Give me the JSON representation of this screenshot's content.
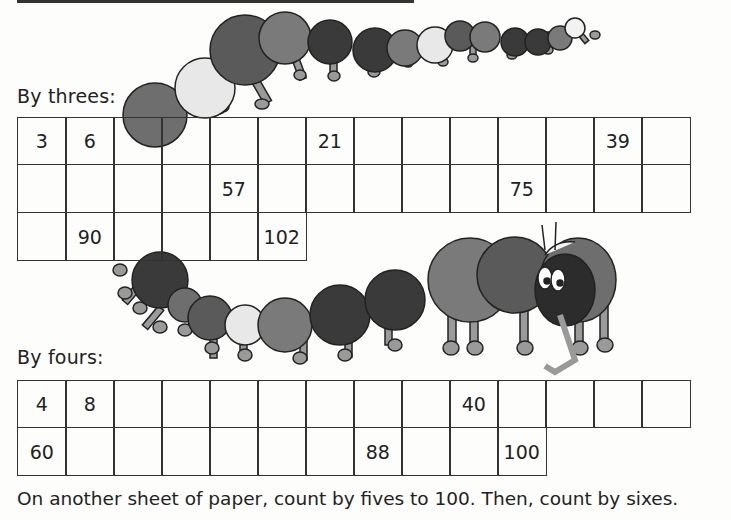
{
  "worksheet": {
    "threes": {
      "label": "By threes:",
      "rows": [
        [
          "3",
          "6",
          "",
          "",
          "",
          "",
          "21",
          "",
          "",
          "",
          "",
          "",
          "39",
          ""
        ],
        [
          "",
          "",
          "",
          "",
          "57",
          "",
          "",
          "",
          "",
          "",
          "75",
          "",
          "",
          ""
        ],
        [
          "",
          "90",
          "",
          "",
          "",
          "102"
        ]
      ]
    },
    "fours": {
      "label": "By fours:",
      "rows": [
        [
          "4",
          "8",
          "",
          "",
          "",
          "",
          "",
          "",
          "",
          "40",
          "",
          "",
          "",
          ""
        ],
        [
          "60",
          "",
          "",
          "",
          "",
          "",
          "",
          "88",
          "",
          "",
          "100"
        ]
      ]
    },
    "instruction": "On another sheet of paper, count by fives to 100. Then, count by sixes."
  },
  "colors": {
    "ink": "#222222",
    "segment_dark": "#3a3a3a",
    "segment_mid": "#6e6e6e",
    "segment_gray": "#8a8a8a",
    "segment_light": "#e8e8e8",
    "legs": "#9a9a9a"
  }
}
